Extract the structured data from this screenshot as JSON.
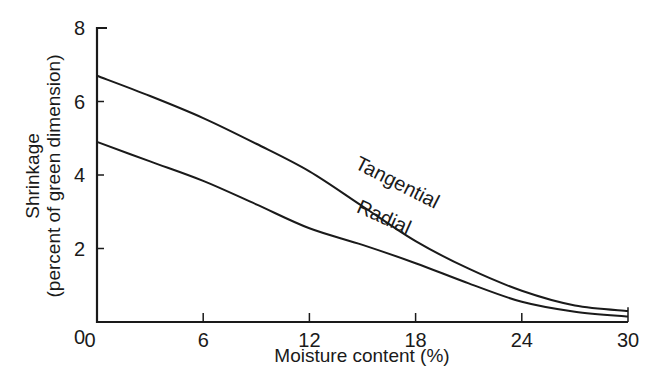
{
  "chart_data": {
    "type": "line",
    "title": "",
    "xlabel": "Moisture content (%)",
    "ylabel_line1": "Shrinkage",
    "ylabel_line2": "(percent of green dimension)",
    "xlim": [
      0,
      30
    ],
    "ylim": [
      0,
      8
    ],
    "xticks": [
      0,
      6,
      12,
      18,
      24,
      30
    ],
    "yticks": [
      0,
      2,
      4,
      6,
      8
    ],
    "grid": false,
    "legend": "inline labels on curves",
    "x": [
      0,
      3,
      6,
      9,
      12,
      15,
      18,
      21,
      24,
      27,
      30
    ],
    "series": [
      {
        "name": "Tangential",
        "values": [
          6.7,
          6.15,
          5.55,
          4.85,
          4.1,
          3.15,
          2.2,
          1.45,
          0.85,
          0.45,
          0.3
        ]
      },
      {
        "name": "Radial",
        "values": [
          4.9,
          4.37,
          3.84,
          3.2,
          2.55,
          2.1,
          1.6,
          1.05,
          0.55,
          0.28,
          0.15
        ]
      }
    ],
    "annotations": [
      {
        "text": "Tangential",
        "x": 14.5,
        "y": 4.2
      },
      {
        "text": "Radial",
        "x": 14.6,
        "y": 3.0
      }
    ]
  },
  "colors": {
    "line": "#1a1a1a",
    "background": "#ffffff"
  }
}
